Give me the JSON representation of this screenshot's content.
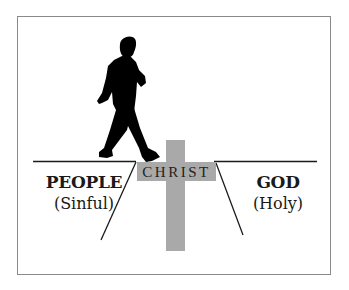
{
  "diagram": {
    "left_side": {
      "title": "PEOPLE",
      "subtitle": "(Sinful)"
    },
    "right_side": {
      "title": "GOD",
      "subtitle": "(Holy)"
    },
    "bridge": {
      "label": "CHRIST"
    },
    "icons": {
      "walker": "walking-man-silhouette-icon",
      "cross": "cross-icon"
    },
    "colors": {
      "cross": "#a9a9a9",
      "lines": "#1a1a1a",
      "silhouette": "#000000",
      "frame": "#8a8a8a"
    }
  }
}
